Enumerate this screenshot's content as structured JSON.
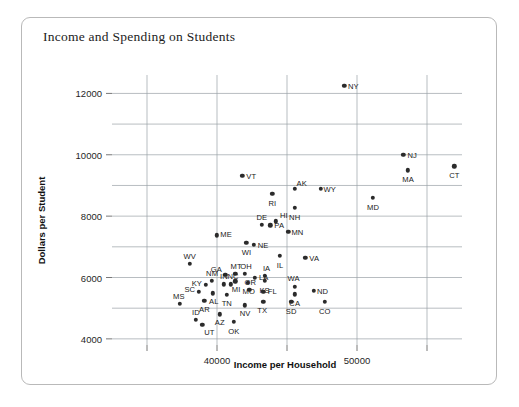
{
  "chart_data": {
    "type": "scatter",
    "title": "Income and Spending on Students",
    "xlabel": "Income per Household",
    "ylabel": "Dollars per Student",
    "xlim": [
      32500,
      57500
    ],
    "ylim": [
      3800,
      12600
    ],
    "xticks": [
      40000,
      50000
    ],
    "yticks": [
      4000,
      6000,
      8000,
      10000,
      12000
    ],
    "xgridlines": [
      35000,
      40000,
      45000,
      50000,
      55000
    ],
    "ygridlines": [
      4000,
      5000,
      6000,
      7000,
      8000,
      9000,
      10000,
      11000,
      12000
    ],
    "grid": true,
    "legend": "none",
    "point_label_field": "state",
    "points": [
      {
        "state": "NY",
        "x": 49100,
        "y": 12250,
        "lx": 9,
        "ly": 0
      },
      {
        "state": "NJ",
        "x": 53300,
        "y": 10000,
        "lx": 9,
        "ly": 0
      },
      {
        "state": "CT",
        "x": 56950,
        "y": 9620,
        "lx": 0,
        "ly": 9
      },
      {
        "state": "MA",
        "x": 53650,
        "y": 9500,
        "lx": 0,
        "ly": 9
      },
      {
        "state": "VT",
        "x": 41800,
        "y": 9320,
        "lx": 9,
        "ly": 0
      },
      {
        "state": "AK",
        "x": 45550,
        "y": 8900,
        "lx": 7,
        "ly": -6
      },
      {
        "state": "WY",
        "x": 47400,
        "y": 8900,
        "lx": 9,
        "ly": 0
      },
      {
        "state": "RI",
        "x": 43950,
        "y": 8720,
        "lx": 0,
        "ly": 9
      },
      {
        "state": "MD",
        "x": 51150,
        "y": 8600,
        "lx": 0,
        "ly": 9
      },
      {
        "state": "NH",
        "x": 45550,
        "y": 8280,
        "lx": 0,
        "ly": 9
      },
      {
        "state": "HI",
        "x": 44200,
        "y": 7830,
        "lx": 8,
        "ly": -6
      },
      {
        "state": "DE",
        "x": 43200,
        "y": 7720,
        "lx": 0,
        "ly": -8
      },
      {
        "state": "PA",
        "x": 43800,
        "y": 7700,
        "lx": 9,
        "ly": 0
      },
      {
        "state": "MN",
        "x": 45100,
        "y": 7480,
        "lx": 9,
        "ly": 0
      },
      {
        "state": "ME",
        "x": 40000,
        "y": 7380,
        "lx": 9,
        "ly": -1
      },
      {
        "state": "WI",
        "x": 42100,
        "y": 7140,
        "lx": 0,
        "ly": 9
      },
      {
        "state": "NE",
        "x": 42650,
        "y": 7060,
        "lx": 9,
        "ly": 0
      },
      {
        "state": "IL",
        "x": 44500,
        "y": 6700,
        "lx": 0,
        "ly": 9
      },
      {
        "state": "VA",
        "x": 46300,
        "y": 6650,
        "lx": 9,
        "ly": 0
      },
      {
        "state": "WV",
        "x": 38050,
        "y": 6450,
        "lx": 0,
        "ly": -8
      },
      {
        "state": "OH",
        "x": 42000,
        "y": 6130,
        "lx": 1,
        "ly": -8
      },
      {
        "state": "GA",
        "x": 40600,
        "y": 6080,
        "lx": -9,
        "ly": -6
      },
      {
        "state": "MT",
        "x": 41300,
        "y": 6130,
        "lx": 1,
        "ly": -8
      },
      {
        "state": "IA",
        "x": 43400,
        "y": 6050,
        "lx": 2,
        "ly": -8
      },
      {
        "state": "LA",
        "x": 42700,
        "y": 6000,
        "lx": 9,
        "ly": -1
      },
      {
        "state": "KS",
        "x": 43400,
        "y": 5900,
        "lx": 0,
        "ly": 9
      },
      {
        "state": "MI",
        "x": 41300,
        "y": 5880,
        "lx": 1,
        "ly": 8
      },
      {
        "state": "MO",
        "x": 42200,
        "y": 5830,
        "lx": 1,
        "ly": 8
      },
      {
        "state": "NM",
        "x": 39650,
        "y": 5900,
        "lx": 0,
        "ly": -8
      },
      {
        "state": "IN",
        "x": 40500,
        "y": 5780,
        "lx": 0,
        "ly": -8
      },
      {
        "state": "NC",
        "x": 41000,
        "y": 5780,
        "lx": 2,
        "ly": -8
      },
      {
        "state": "KY",
        "x": 39200,
        "y": 5760,
        "lx": -9,
        "ly": -2
      },
      {
        "state": "WA",
        "x": 45550,
        "y": 5700,
        "lx": -1,
        "ly": -9
      },
      {
        "state": "OR",
        "x": 42300,
        "y": 5600,
        "lx": 1,
        "ly": -8
      },
      {
        "state": "ND",
        "x": 46900,
        "y": 5560,
        "lx": 9,
        "ly": 0
      },
      {
        "state": "FL",
        "x": 43300,
        "y": 5530,
        "lx": 9,
        "ly": -1
      },
      {
        "state": "SC",
        "x": 38700,
        "y": 5540,
        "lx": -9,
        "ly": -3
      },
      {
        "state": "AL",
        "x": 39700,
        "y": 5480,
        "lx": 1,
        "ly": 8
      },
      {
        "state": "TN",
        "x": 40700,
        "y": 5440,
        "lx": 0,
        "ly": 8
      },
      {
        "state": "CA",
        "x": 45550,
        "y": 5450,
        "lx": 0,
        "ly": 9
      },
      {
        "state": "AR",
        "x": 39100,
        "y": 5250,
        "lx": 0,
        "ly": 8
      },
      {
        "state": "TX",
        "x": 43300,
        "y": 5200,
        "lx": -1,
        "ly": 8
      },
      {
        "state": "MS",
        "x": 37350,
        "y": 5150,
        "lx": -1,
        "ly": -8
      },
      {
        "state": "SD",
        "x": 45300,
        "y": 5200,
        "lx": 0,
        "ly": 9
      },
      {
        "state": "CO",
        "x": 47700,
        "y": 5200,
        "lx": 0,
        "ly": 9
      },
      {
        "state": "NV",
        "x": 42000,
        "y": 5100,
        "lx": 0,
        "ly": 8
      },
      {
        "state": "AZ",
        "x": 40200,
        "y": 4800,
        "lx": 0,
        "ly": 8
      },
      {
        "state": "ID",
        "x": 38500,
        "y": 4620,
        "lx": 0,
        "ly": -8
      },
      {
        "state": "OK",
        "x": 41200,
        "y": 4560,
        "lx": 0,
        "ly": 9
      },
      {
        "state": "UT",
        "x": 38950,
        "y": 4450,
        "lx": 7,
        "ly": 7
      }
    ]
  }
}
